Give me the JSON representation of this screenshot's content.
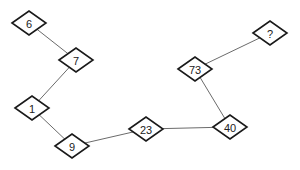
{
  "diagram": {
    "nodes": [
      {
        "id": "n6",
        "label": "6",
        "x": 29,
        "y": 23
      },
      {
        "id": "n7",
        "label": "7",
        "x": 76,
        "y": 60
      },
      {
        "id": "n1",
        "label": "1",
        "x": 32,
        "y": 108
      },
      {
        "id": "n9",
        "label": "9",
        "x": 72,
        "y": 146
      },
      {
        "id": "n23",
        "label": "23",
        "x": 146,
        "y": 129
      },
      {
        "id": "n40",
        "label": "40",
        "x": 230,
        "y": 127
      },
      {
        "id": "n73",
        "label": "73",
        "x": 195,
        "y": 69
      },
      {
        "id": "nq",
        "label": "?",
        "x": 270,
        "y": 33
      }
    ],
    "edges": [
      [
        "n6",
        "n7"
      ],
      [
        "n7",
        "n1"
      ],
      [
        "n1",
        "n9"
      ],
      [
        "n9",
        "n23"
      ],
      [
        "n23",
        "n40"
      ],
      [
        "n40",
        "n73"
      ],
      [
        "n73",
        "nq"
      ]
    ],
    "colors": {
      "edge": "#6b6b6b",
      "node_stroke": "#1a1a1a",
      "node_fill": "#ffffff",
      "text": "#222222"
    }
  }
}
